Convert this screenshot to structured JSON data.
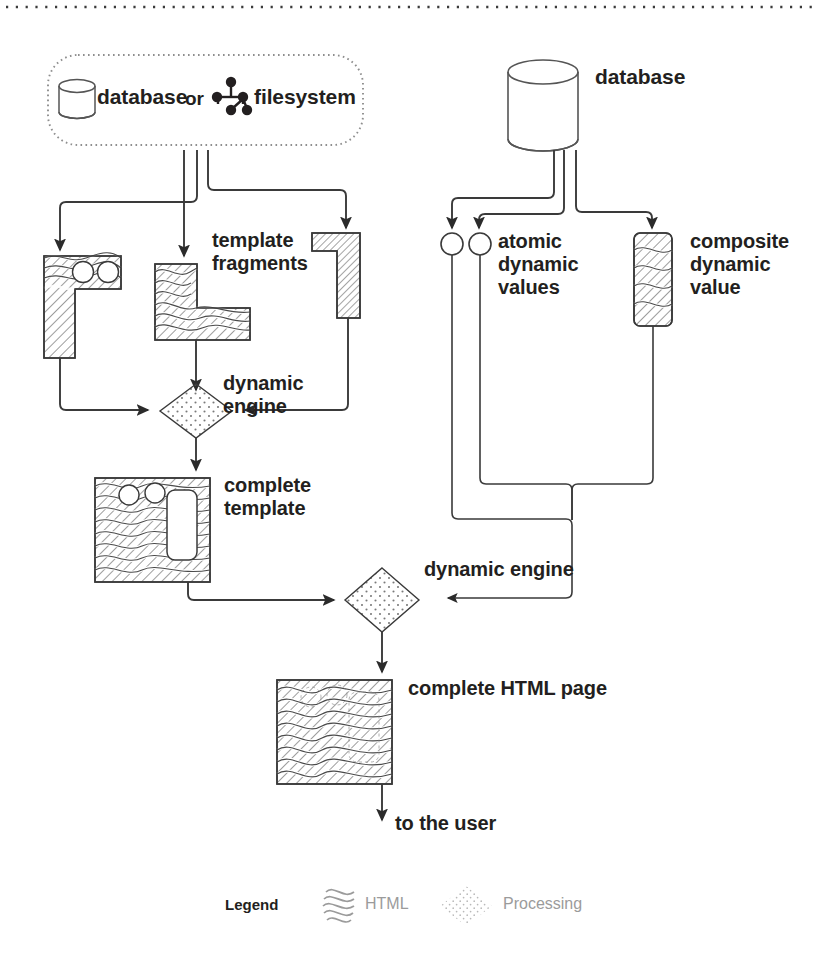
{
  "diagram": {
    "top_rule": "dotted-page-divider",
    "source_box": {
      "database_label": "database",
      "connector_label": "or",
      "filesystem_label": "filesystem",
      "database_icon": "database-cylinder-icon",
      "filesystem_icon": "file-tree-icon",
      "border_style": "dotted-rounded"
    },
    "right_database": {
      "label": "database",
      "icon": "database-cylinder-icon"
    },
    "template_fragments": {
      "label": "template\nfragments",
      "label_line1": "template",
      "label_line2": "fragments",
      "count": 3,
      "fragment_shapes": [
        "gamma-with-circles",
        "l-shape-wavy",
        "gamma-thin-hatch"
      ]
    },
    "atomic_values": {
      "label_line1": "atomic",
      "label_line2": "dynamic",
      "label_line3": "values",
      "count": 2,
      "shape": "circle-outline"
    },
    "composite_value": {
      "label_line1": "composite",
      "label_line2": "dynamic",
      "label_line3": "value",
      "shape": "rounded-rect-hatched"
    },
    "dynamic_engine_top": {
      "label_line1": "dynamic",
      "label_line2": "engine",
      "shape": "dotted-diamond"
    },
    "complete_template": {
      "label_line1": "complete",
      "label_line2": "template",
      "shape": "hatched-square-with-placeholders"
    },
    "dynamic_engine_bottom": {
      "label": "dynamic engine",
      "shape": "dotted-diamond"
    },
    "complete_html_page": {
      "label": "complete HTML page",
      "shape": "hatched-square"
    },
    "output": {
      "label": "to the user"
    }
  },
  "legend": {
    "title": "Legend",
    "items": [
      {
        "label": "HTML",
        "swatch": "wavy-lines-swatch"
      },
      {
        "label": "Processing",
        "swatch": "dotted-diamond-swatch"
      }
    ]
  },
  "colors": {
    "ink": "#231f20",
    "line": "#3a3a3a",
    "hatch": "#4a4a4a",
    "legend_gray": "#9b9b9b",
    "background": "#ffffff"
  }
}
